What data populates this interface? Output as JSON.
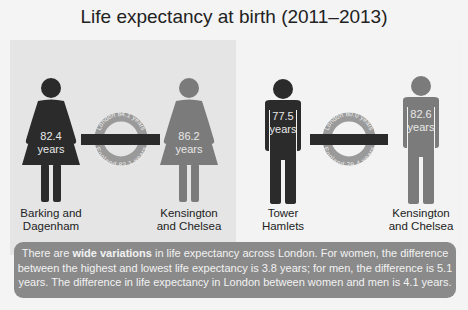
{
  "title": "Life expectancy at birth (2011–2013)",
  "women": {
    "lowest": {
      "area": "Barking and Dagenham",
      "area_line1": "Barking and",
      "area_line2": "Dagenham",
      "value": "82.4",
      "unit": "years",
      "color": "#2b2b2b"
    },
    "highest": {
      "area": "Kensington and Chelsea",
      "area_line1": "Kensington",
      "area_line2": "and Chelsea",
      "value": "86.2",
      "unit": "years",
      "color": "#7b7b7b"
    },
    "roundel": {
      "top_text": "London 84.1 years",
      "bottom_text": "England 83.1 years"
    }
  },
  "men": {
    "lowest": {
      "area": "Tower Hamlets",
      "area_line1": "Tower",
      "area_line2": "Hamlets",
      "value": "77.5",
      "unit": "years",
      "color": "#2b2b2b"
    },
    "highest": {
      "area": "Kensington and Chelsea",
      "area_line1": "Kensington",
      "area_line2": "and Chelsea",
      "value": "82.6",
      "unit": "years",
      "color": "#7b7b7b"
    },
    "roundel": {
      "top_text": "London 80.0 years",
      "bottom_text": "England 79.4 years"
    }
  },
  "note": {
    "prefix": "There are ",
    "bold": "wide variations",
    "rest": " in life expectancy across London. For women, the difference between the highest and lowest life expectancy is 3.8 years; for men, the difference is 5.1 years. The difference in life expectancy in London between women and men is 4.1 years."
  },
  "colors": {
    "dark": "#2b2b2b",
    "light": "#7b7b7b",
    "ring": "#9a9a9a",
    "note_bg": "#8a8a8a"
  }
}
